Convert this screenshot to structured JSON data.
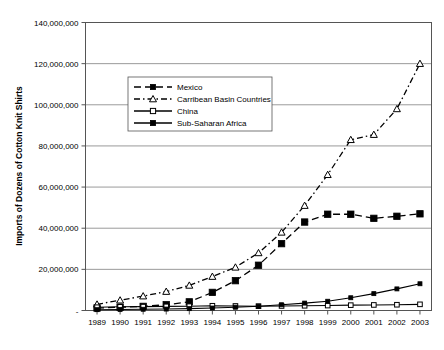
{
  "chart_data": {
    "type": "line",
    "title": "",
    "xlabel": "",
    "ylabel": "Imports of Dozens of Cotton Knit Shirts",
    "x": [
      1989,
      1990,
      1991,
      1992,
      1993,
      1994,
      1995,
      1996,
      1997,
      1998,
      1999,
      2000,
      2001,
      2002,
      2003
    ],
    "categories": [
      "1989",
      "1990",
      "1991",
      "1992",
      "1993",
      "1994",
      "1995",
      "1996",
      "1997",
      "1998",
      "1999",
      "2000",
      "2001",
      "2002",
      "2003"
    ],
    "ylim": [
      0,
      140000000
    ],
    "ytick_values": [
      0,
      20000000,
      40000000,
      60000000,
      80000000,
      100000000,
      120000000,
      140000000
    ],
    "ytick_labels": [
      "-",
      "20,000,000",
      "40,000,000",
      "60,000,000",
      "80,000,000",
      "100,000,000",
      "120,000,000",
      "140,000,000"
    ],
    "grid": true,
    "legend_position": "upper-left-inside",
    "series": [
      {
        "name": "Mexico",
        "marker": "filled-square",
        "dash": "dashed",
        "values": [
          1200000,
          1600000,
          2000000,
          2800000,
          4200000,
          8800000,
          14500000,
          22000000,
          32500000,
          43000000,
          46800000,
          46800000,
          44800000,
          45800000,
          47000000
        ]
      },
      {
        "name": "Carribean Basin Countries",
        "marker": "open-triangle",
        "dash": "dash-dot",
        "values": [
          3000000,
          5000000,
          7000000,
          9200000,
          12200000,
          16500000,
          21000000,
          28000000,
          38000000,
          51000000,
          66000000,
          83000000,
          85500000,
          98000000,
          120000000
        ]
      },
      {
        "name": "China",
        "marker": "open-square",
        "dash": "solid",
        "values": [
          1600000,
          1800000,
          1900000,
          2000000,
          2100000,
          2300000,
          2200000,
          2100000,
          2200000,
          2300000,
          2400000,
          2600000,
          2700000,
          2800000,
          3000000
        ]
      },
      {
        "name": "Sub-Saharan Africa",
        "marker": "filled-square",
        "dash": "solid",
        "values": [
          400000,
          500000,
          600000,
          700000,
          900000,
          1200000,
          1600000,
          2100000,
          2800000,
          3600000,
          4500000,
          6200000,
          8200000,
          10500000,
          13000000
        ]
      }
    ]
  },
  "legend": {
    "items": [
      {
        "label": "Mexico"
      },
      {
        "label": "Carribean Basin Countries"
      },
      {
        "label": "China"
      },
      {
        "label": "Sub-Saharan Africa"
      }
    ]
  }
}
